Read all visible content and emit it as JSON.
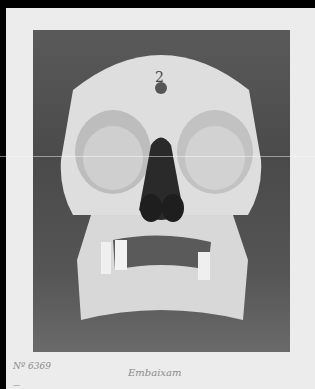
{
  "image": {
    "description": "Black-and-white photograph of a human skull, frontal view, mounted on a light card",
    "subject": "skull-frontal-view",
    "colors": {
      "frame": "#000000",
      "card": "#ececec",
      "photo_background": "#505050",
      "bone": "#e6e6e6",
      "shadow": "#2a2a2a"
    }
  },
  "labels": {
    "catalog_number": "Nº 6369",
    "second_line": "—",
    "name": "Embaixam"
  }
}
